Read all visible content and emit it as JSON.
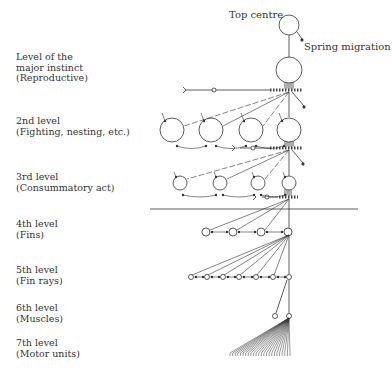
{
  "diagram": {
    "top_centre_label": "Top centre",
    "spring_migration_label": "Spring migration",
    "levels": [
      {
        "line1": "Level of the",
        "line2": "major instinct",
        "line3": "(Reproductive)"
      },
      {
        "line1": "2nd level",
        "line2": "(Fighting, nesting, etc.)"
      },
      {
        "line1": "3rd level",
        "line2": "(Consummatory act)"
      },
      {
        "line1": "4th level",
        "line2": "(Fins)"
      },
      {
        "line1": "5th level",
        "line2": "(Fin rays)"
      },
      {
        "line1": "6th level",
        "line2": "(Muscles)"
      },
      {
        "line1": "7th level",
        "line2": "(Motor units)"
      }
    ],
    "nodes": {
      "top_centre": {
        "x": 289,
        "y": 25,
        "r": 10
      },
      "major_instinct": {
        "x": 289,
        "y": 70,
        "r": 13
      },
      "level2": [
        172,
        211,
        251,
        289
      ],
      "level3": [
        180,
        220,
        258,
        289
      ],
      "level4": [
        206,
        233,
        261,
        288
      ],
      "level5": [
        191,
        207,
        223,
        239,
        256,
        273,
        289
      ],
      "level6": [
        275,
        289
      ],
      "motor_unit_count": 24
    },
    "colors": {
      "ink": "#333333",
      "background": "#ffffff"
    }
  }
}
